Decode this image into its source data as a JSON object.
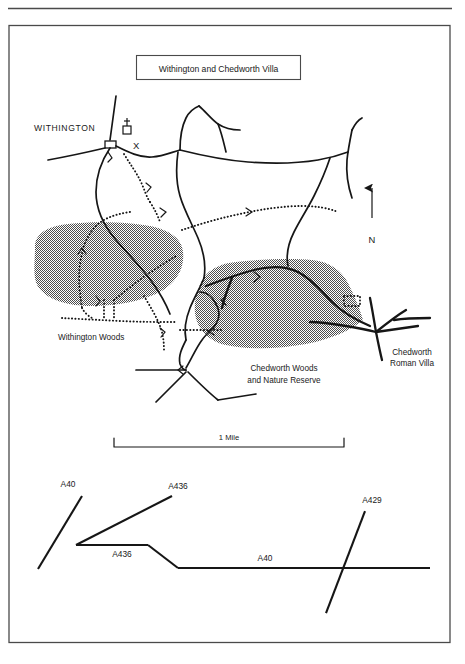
{
  "figure": {
    "title_box_label": "Withington and Chedworth Villa",
    "has_top_rule": true,
    "border": {
      "color": "#4a4a4a"
    }
  },
  "map": {
    "settlements": [
      {
        "name": "WITHINGTON",
        "label": "WITHINGTON"
      }
    ],
    "symbols": [
      {
        "name": "church-symbol",
        "label": ""
      },
      {
        "name": "x-marker",
        "label": "X"
      },
      {
        "name": "villa-outline",
        "label": ""
      }
    ],
    "woodland": [
      {
        "name": "withington-woods",
        "label": "Withington Woods",
        "fill": "#9a9a9a"
      },
      {
        "name": "chedworth-woods",
        "label_line1": "Chedworth Woods",
        "label_line2": "and Nature Reserve",
        "fill": "#9a9a9a"
      }
    ],
    "sites": [
      {
        "name": "chedworth-roman-villa",
        "label_line1": "Chedworth",
        "label_line2": "Roman Villa"
      }
    ],
    "compass": {
      "label": "N",
      "direction": "up"
    },
    "scale_bar": {
      "label": "1 Mile"
    }
  },
  "road_diagram": {
    "labels": [
      {
        "name": "a40-northwest",
        "text": "A40"
      },
      {
        "name": "a436-northeast",
        "text": "A436"
      },
      {
        "name": "a436-link",
        "text": "A436"
      },
      {
        "name": "a40-east",
        "text": "A40"
      },
      {
        "name": "a429",
        "text": "A429"
      }
    ]
  }
}
